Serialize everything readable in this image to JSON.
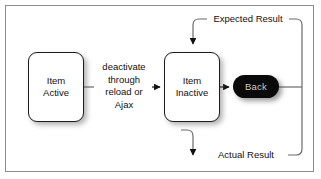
{
  "diagram": {
    "frame": {
      "border_color": "#8d8d8d",
      "background": "#ffffff"
    },
    "nodes": [
      {
        "id": "item-active",
        "label": "Item\nActive",
        "shape": "rounded-rectangle",
        "fill": "#ffffff",
        "stroke": "#1b1b1b",
        "text_color": "#111111"
      },
      {
        "id": "item-inactive",
        "label": "Item\nInactive",
        "shape": "rounded-rectangle",
        "fill": "#ffffff",
        "stroke": "#1b1b1b",
        "text_color": "#111111"
      },
      {
        "id": "back",
        "label": "Back",
        "shape": "pill-button",
        "fill": "#0a0a0a",
        "stroke": "#0a0a0a",
        "text_color": "#c9c9c9"
      }
    ],
    "edges": [
      {
        "id": "deactivate",
        "from": "item-active",
        "to": "item-inactive",
        "label": "deactivate\nthrough\nreload or\nAjax",
        "arrowhead": "solid-triangle"
      },
      {
        "id": "to-back",
        "from": "item-inactive",
        "to": "back",
        "label": "",
        "arrowhead": "solid-triangle"
      },
      {
        "id": "expected-result",
        "from": "back",
        "to": "item-inactive",
        "label": "Expected Result",
        "arrowhead": "solid-triangle",
        "routing": "right-up-left-down"
      },
      {
        "id": "actual-result",
        "from": "back",
        "to": "item-inactive",
        "label": "Actual Result",
        "arrowhead": "solid-triangle",
        "routing": "right-down-left-up"
      }
    ],
    "colors": {
      "line": "#6a6a6a",
      "line_dark": "#1b1b1b",
      "frame": "#8d8d8d",
      "node_fill": "#ffffff",
      "button_fill": "#0a0a0a",
      "button_text": "#c9c9c9"
    }
  }
}
